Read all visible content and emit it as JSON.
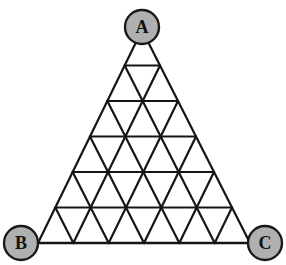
{
  "figure": {
    "name": "triangular-lattice-graph",
    "type": "diagram",
    "background_color": "#ffffff",
    "line_color": "#151515",
    "line_width_outer": 2.6,
    "line_width_inner": 2.2,
    "subdivisions": 6,
    "geometry": {
      "apex": {
        "x": 142,
        "y": 30
      },
      "bottom_left": {
        "x": 38,
        "y": 243
      },
      "bottom_right": {
        "x": 250,
        "y": 243
      },
      "row_y": [
        30,
        65,
        101,
        136,
        172,
        207,
        243
      ]
    }
  },
  "nodes": [
    {
      "id": "A",
      "label": "A",
      "cx": 142,
      "cy": 27,
      "r": 17,
      "fill": "#b0b0b0",
      "stroke": "#1a1a1a",
      "stroke_width": 2.4,
      "name": "node-a"
    },
    {
      "id": "B",
      "label": "B",
      "cx": 21,
      "cy": 243,
      "r": 17,
      "fill": "#b0b0b0",
      "stroke": "#1a1a1a",
      "stroke_width": 2.4,
      "name": "node-b"
    },
    {
      "id": "C",
      "label": "C",
      "cx": 265,
      "cy": 243,
      "r": 17,
      "fill": "#b0b0b0",
      "stroke": "#1a1a1a",
      "stroke_width": 2.4,
      "name": "node-c"
    }
  ],
  "labels": {
    "a": "A",
    "b": "B",
    "c": "C"
  }
}
